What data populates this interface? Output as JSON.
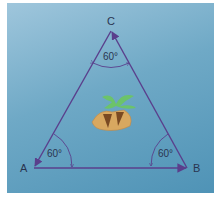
{
  "diagram": {
    "type": "equilateral triangle",
    "vertices": [
      {
        "name": "A",
        "label": "A"
      },
      {
        "name": "B",
        "label": "B"
      },
      {
        "name": "C",
        "label": "C"
      }
    ],
    "angles": {
      "A": "60°",
      "B": "60°",
      "C": "60°"
    },
    "center_icon": "island-palm-icon",
    "colors": {
      "background": "#6fa9c6",
      "edges": "#5a3f8c",
      "palm": "#6cc36a",
      "island": "#d8a860"
    }
  }
}
